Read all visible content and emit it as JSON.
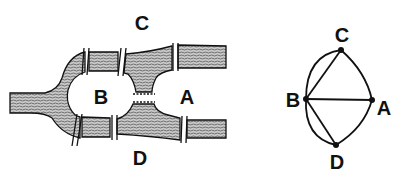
{
  "figure": {
    "map": {
      "labels": {
        "A": "A",
        "B": "B",
        "C": "C",
        "D": "D"
      },
      "bridges": 7
    },
    "graph": {
      "nodes": [
        "A",
        "B",
        "C",
        "D"
      ],
      "edges": [
        [
          "B",
          "C"
        ],
        [
          "B",
          "C"
        ],
        [
          "B",
          "A"
        ],
        [
          "B",
          "D"
        ],
        [
          "B",
          "D"
        ],
        [
          "C",
          "A"
        ],
        [
          "D",
          "A"
        ]
      ],
      "labels": {
        "A": "A",
        "B": "B",
        "C": "C",
        "D": "D"
      }
    },
    "colors": {
      "ink": "#111111",
      "water": "#9a9a9a",
      "background": "#ffffff"
    }
  }
}
